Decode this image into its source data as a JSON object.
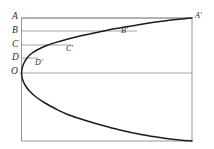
{
  "figure": {
    "background_color": "#ffffff",
    "frame_color": "#8d8d8d",
    "grid_color": "#8d8d8d",
    "curve_color": "#1c1c1c",
    "label_color": "#2b2b2b"
  },
  "axis_labels": [
    {
      "text": "A",
      "x": 12,
      "y": 12
    },
    {
      "text": "B",
      "x": 12,
      "y": 26
    },
    {
      "text": "C",
      "x": 12,
      "y": 40
    },
    {
      "text": "D",
      "x": 12,
      "y": 53
    },
    {
      "text": "O",
      "x": 11,
      "y": 67
    }
  ],
  "curve_labels": [
    {
      "text": "A'",
      "x": 195,
      "y": 12
    },
    {
      "text": "B'",
      "x": 121,
      "y": 27
    },
    {
      "text": "C'",
      "x": 66,
      "y": 45
    },
    {
      "text": "D'",
      "x": 35,
      "y": 59
    }
  ],
  "chart_data": {
    "type": "line",
    "xlabel": "",
    "ylabel": "",
    "grid": true,
    "legend": null,
    "frame": {
      "left": 21.5,
      "top": 18,
      "right": 192,
      "bottom": 141
    },
    "gridlines": [
      {
        "label": "A",
        "y": 18,
        "x_start": 21.5,
        "x_end": 192
      },
      {
        "label": "B",
        "y": 31,
        "x_start": 21.5,
        "x_end": 137
      },
      {
        "label": "C",
        "y": 45,
        "x_start": 21.5,
        "x_end": 71
      },
      {
        "label": "D",
        "y": 58,
        "x_start": 21.5,
        "x_end": 38
      },
      {
        "label": "O",
        "y": 73,
        "x_start": 21.5,
        "x_end": 192
      }
    ],
    "upper_branch": {
      "name": "upper branch",
      "points": [
        [
          21.5,
          73
        ],
        [
          22.2,
          68
        ],
        [
          24.0,
          63
        ],
        [
          27.0,
          58
        ],
        [
          31.5,
          53.5
        ],
        [
          38.0,
          49.5
        ],
        [
          46.0,
          45.8
        ],
        [
          56.0,
          42.4
        ],
        [
          68.0,
          39.0
        ],
        [
          82.0,
          35.6
        ],
        [
          98.0,
          32.2
        ],
        [
          116.0,
          28.6
        ],
        [
          136.0,
          25.2
        ],
        [
          158.0,
          21.8
        ],
        [
          176.0,
          19.6
        ],
        [
          192.0,
          18.0
        ]
      ]
    },
    "lower_branch": {
      "name": "lower branch",
      "points": [
        [
          21.5,
          73
        ],
        [
          22.4,
          79
        ],
        [
          25.0,
          85
        ],
        [
          29.5,
          91
        ],
        [
          36.0,
          97
        ],
        [
          45.0,
          103
        ],
        [
          56.0,
          109
        ],
        [
          69.0,
          115
        ],
        [
          84.0,
          120
        ],
        [
          101.0,
          125
        ],
        [
          120.0,
          130
        ],
        [
          141.0,
          134.5
        ],
        [
          163.0,
          138
        ],
        [
          180.0,
          140
        ],
        [
          192.0,
          141
        ]
      ]
    },
    "marked_points": [
      {
        "label": "A'",
        "x": 192,
        "y": 18
      },
      {
        "label": "B'",
        "x": 116,
        "y": 28.6
      },
      {
        "label": "C'",
        "x": 63,
        "y": 40
      },
      {
        "label": "D'",
        "x": 31,
        "y": 53.5
      }
    ]
  }
}
